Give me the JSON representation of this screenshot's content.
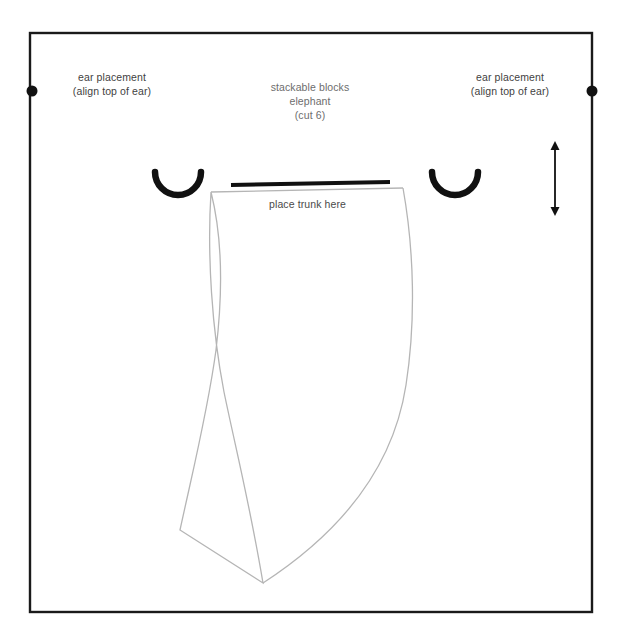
{
  "page": {
    "background_color": "#ffffff",
    "width": 621,
    "height": 641
  },
  "colors": {
    "frame": "#1a1a1a",
    "pattern_outline": "#b5b5b5",
    "ink_black": "#111111",
    "label_text": "#3f3f3f",
    "title_text": "#6d6d6d"
  },
  "title_block": {
    "line1": "stackable blocks",
    "line2": "elephant",
    "line3": "(cut 6)",
    "text": "stackable blocks\nelephant\n(cut 6)"
  },
  "annotations": {
    "ear_left": {
      "line1": "ear placement",
      "line2": "(align top of ear)",
      "text": "ear placement\n(align top of ear)"
    },
    "ear_right": {
      "line1": "ear placement",
      "line2": "(align top of ear)",
      "text": "ear placement\n(align top of ear)"
    },
    "trunk": {
      "text": "place trunk here"
    }
  },
  "markers": {
    "ear_dot_left": {
      "name": "ear-placement-dot-left",
      "cx": 32,
      "cy": 91,
      "r": 5.5
    },
    "ear_dot_right": {
      "name": "ear-placement-dot-right",
      "cx": 592,
      "cy": 91,
      "r": 5.5
    },
    "ear_arc_left": {
      "name": "ear-arc-left"
    },
    "ear_arc_right": {
      "name": "ear-arc-right"
    },
    "trunk_edge_line": {
      "name": "trunk-placement-edge"
    },
    "height_arrow": {
      "name": "height-dimension-arrow",
      "x": 555,
      "y_top": 142,
      "y_bottom": 215
    }
  },
  "frame": {
    "x": 30,
    "y": 33,
    "width": 562,
    "height": 579
  },
  "pattern_piece": {
    "name": "elephant-body-panel",
    "outline_color": "#b5b5b5"
  }
}
